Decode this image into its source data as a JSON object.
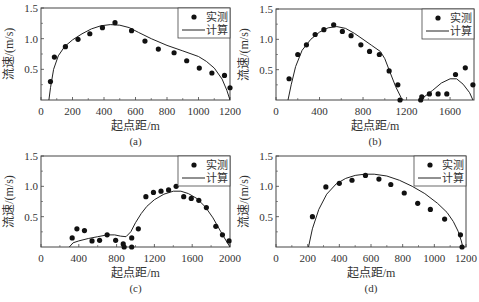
{
  "figure": {
    "legend": {
      "measured": "实测",
      "computed": "计算"
    },
    "xlabel": "起点距/m",
    "ylabel": "流速/(m/s)",
    "colors": {
      "line": "#222222",
      "marker": "#111111",
      "frame": "#444444"
    }
  },
  "chart_data": [
    {
      "type": "line+scatter",
      "panel": "(a)",
      "xlabel": "起点距/m",
      "ylabel": "流速/(m/s)",
      "xlim": [
        0,
        1200
      ],
      "ylim": [
        0,
        1.5
      ],
      "xticks": [
        0,
        200,
        400,
        600,
        800,
        1000,
        1200
      ],
      "xminor": [
        100,
        300,
        500,
        700,
        900,
        1100
      ],
      "yticks": [
        0.5,
        1.0,
        1.5
      ],
      "ytick_labels": [
        "0.5",
        "1.0",
        "1.5"
      ],
      "legend": [
        "实测",
        "计算"
      ],
      "legend_position": "upper right",
      "box": {
        "left": 41,
        "right": 230,
        "top": 8,
        "bottom": 100
      },
      "measured": [
        [
          60,
          0.3
        ],
        [
          85,
          0.7
        ],
        [
          155,
          0.87
        ],
        [
          235,
          0.99
        ],
        [
          310,
          1.08
        ],
        [
          390,
          1.18
        ],
        [
          470,
          1.26
        ],
        [
          575,
          1.13
        ],
        [
          660,
          0.96
        ],
        [
          745,
          0.83
        ],
        [
          845,
          0.77
        ],
        [
          925,
          0.64
        ],
        [
          1005,
          0.52
        ],
        [
          1085,
          0.44
        ],
        [
          1165,
          0.4
        ],
        [
          1200,
          0.2
        ]
      ],
      "computed": [
        [
          50,
          0
        ],
        [
          60,
          0.2
        ],
        [
          80,
          0.5
        ],
        [
          110,
          0.72
        ],
        [
          150,
          0.87
        ],
        [
          200,
          0.98
        ],
        [
          260,
          1.08
        ],
        [
          320,
          1.16
        ],
        [
          380,
          1.21
        ],
        [
          440,
          1.23
        ],
        [
          500,
          1.22
        ],
        [
          560,
          1.18
        ],
        [
          620,
          1.1
        ],
        [
          700,
          1.0
        ],
        [
          800,
          0.89
        ],
        [
          900,
          0.8
        ],
        [
          1000,
          0.71
        ],
        [
          1050,
          0.63
        ],
        [
          1100,
          0.52
        ],
        [
          1150,
          0.34
        ],
        [
          1180,
          0.16
        ],
        [
          1200,
          0
        ]
      ]
    },
    {
      "type": "line+scatter",
      "panel": "(b)",
      "xlabel": "起点距/m",
      "ylabel": "流速/(m/s)",
      "xlim": [
        0,
        1820
      ],
      "ylim": [
        0,
        1.5
      ],
      "xticks": [
        0,
        400,
        800,
        1200,
        1600
      ],
      "xminor": [
        200,
        600,
        1000,
        1400
      ],
      "yticks": [
        0.5,
        1.0,
        1.5
      ],
      "ytick_labels": [
        "0.5",
        "1.0",
        "1.5"
      ],
      "legend": [
        "实测",
        "计算"
      ],
      "legend_position": "upper right",
      "box": {
        "left": 276,
        "right": 474,
        "top": 9,
        "bottom": 100
      },
      "measured": [
        [
          120,
          0.35
        ],
        [
          200,
          0.75
        ],
        [
          280,
          0.91
        ],
        [
          360,
          1.08
        ],
        [
          440,
          1.16
        ],
        [
          530,
          1.24
        ],
        [
          610,
          1.13
        ],
        [
          690,
          1.06
        ],
        [
          780,
          0.91
        ],
        [
          860,
          0.8
        ],
        [
          950,
          0.75
        ],
        [
          1040,
          0.48
        ],
        [
          1120,
          0.25
        ],
        [
          1140,
          0.0
        ],
        [
          1330,
          0.0
        ],
        [
          1340,
          0.05
        ],
        [
          1410,
          0.1
        ],
        [
          1490,
          0.1
        ],
        [
          1570,
          0.1
        ],
        [
          1650,
          0.42
        ],
        [
          1740,
          0.53
        ],
        [
          1810,
          0.25
        ]
      ],
      "computed": [
        [
          110,
          0
        ],
        [
          140,
          0.25
        ],
        [
          180,
          0.55
        ],
        [
          240,
          0.82
        ],
        [
          320,
          1.0
        ],
        [
          400,
          1.12
        ],
        [
          480,
          1.19
        ],
        [
          560,
          1.21
        ],
        [
          640,
          1.18
        ],
        [
          720,
          1.1
        ],
        [
          800,
          1.0
        ],
        [
          880,
          0.9
        ],
        [
          960,
          0.8
        ],
        [
          1000,
          0.68
        ],
        [
          1050,
          0.45
        ],
        [
          1100,
          0.22
        ],
        [
          1150,
          0.04
        ],
        [
          1170,
          0
        ],
        [
          1320,
          0
        ],
        [
          1360,
          0.05
        ],
        [
          1440,
          0.16
        ],
        [
          1520,
          0.28
        ],
        [
          1600,
          0.35
        ],
        [
          1660,
          0.35
        ],
        [
          1720,
          0.26
        ],
        [
          1780,
          0.12
        ],
        [
          1810,
          0
        ]
      ]
    },
    {
      "type": "line+scatter",
      "panel": "(c)",
      "xlabel": "起点距/m",
      "ylabel": "流速/(m/s)",
      "xlim": [
        0,
        2000
      ],
      "ylim": [
        0,
        1.5
      ],
      "xticks": [
        0,
        400,
        800,
        1200,
        1600,
        2000
      ],
      "xminor": [
        200,
        600,
        1000,
        1400,
        1800
      ],
      "yticks": [
        0.5,
        1.0,
        1.5
      ],
      "ytick_labels": [
        "0.5",
        "1.0",
        "1.5"
      ],
      "legend": [
        "实测",
        "计算"
      ],
      "legend_position": "upper right",
      "box": {
        "left": 41,
        "right": 230,
        "top": 156,
        "bottom": 247
      },
      "measured": [
        [
          330,
          0.15
        ],
        [
          380,
          0.3
        ],
        [
          460,
          0.27
        ],
        [
          540,
          0.1
        ],
        [
          620,
          0.11
        ],
        [
          700,
          0.2
        ],
        [
          790,
          0.11
        ],
        [
          870,
          0.05
        ],
        [
          880,
          0.0
        ],
        [
          960,
          0.0
        ],
        [
          960,
          0.15
        ],
        [
          1030,
          0.3
        ],
        [
          1110,
          0.83
        ],
        [
          1190,
          0.9
        ],
        [
          1270,
          0.92
        ],
        [
          1350,
          0.94
        ],
        [
          1430,
          1.0
        ],
        [
          1510,
          0.83
        ],
        [
          1590,
          0.8
        ],
        [
          1670,
          0.77
        ],
        [
          1750,
          0.65
        ],
        [
          1850,
          0.34
        ],
        [
          1920,
          0.2
        ],
        [
          1990,
          0.1
        ]
      ],
      "computed": [
        [
          300,
          0
        ],
        [
          340,
          0.07
        ],
        [
          400,
          0.1
        ],
        [
          500,
          0.14
        ],
        [
          600,
          0.17
        ],
        [
          700,
          0.2
        ],
        [
          780,
          0.2
        ],
        [
          840,
          0.18
        ],
        [
          900,
          0.17
        ],
        [
          950,
          0.25
        ],
        [
          1000,
          0.4
        ],
        [
          1060,
          0.55
        ],
        [
          1120,
          0.67
        ],
        [
          1200,
          0.78
        ],
        [
          1300,
          0.87
        ],
        [
          1400,
          0.92
        ],
        [
          1480,
          0.92
        ],
        [
          1560,
          0.88
        ],
        [
          1650,
          0.8
        ],
        [
          1740,
          0.66
        ],
        [
          1820,
          0.48
        ],
        [
          1900,
          0.26
        ],
        [
          1960,
          0.1
        ],
        [
          2000,
          0
        ]
      ]
    },
    {
      "type": "line+scatter",
      "panel": "(d)",
      "xlabel": "起点距/m",
      "ylabel": "流速/(m/s)",
      "xlim": [
        0,
        1200
      ],
      "ylim": [
        0,
        1.5
      ],
      "xticks": [
        0,
        200,
        400,
        600,
        800,
        1000,
        1200
      ],
      "xminor": [
        100,
        300,
        500,
        700,
        900,
        1100
      ],
      "yticks": [
        0.5,
        1.0,
        1.5
      ],
      "ytick_labels": [
        "0.5",
        "1.0",
        "1.5"
      ],
      "legend": [
        "实测",
        "计算"
      ],
      "legend_position": "upper right",
      "box": {
        "left": 276,
        "right": 466,
        "top": 156,
        "bottom": 247
      },
      "measured": [
        [
          230,
          0.5
        ],
        [
          315,
          0.99
        ],
        [
          400,
          1.05
        ],
        [
          480,
          1.1
        ],
        [
          565,
          1.18
        ],
        [
          650,
          1.12
        ],
        [
          725,
          1.03
        ],
        [
          810,
          0.89
        ],
        [
          895,
          0.72
        ],
        [
          975,
          0.62
        ],
        [
          1065,
          0.46
        ],
        [
          1165,
          0.2
        ],
        [
          1175,
          0.0
        ]
      ],
      "computed": [
        [
          205,
          0
        ],
        [
          230,
          0.3
        ],
        [
          270,
          0.62
        ],
        [
          320,
          0.87
        ],
        [
          380,
          1.04
        ],
        [
          440,
          1.13
        ],
        [
          500,
          1.18
        ],
        [
          560,
          1.2
        ],
        [
          620,
          1.2
        ],
        [
          700,
          1.17
        ],
        [
          780,
          1.1
        ],
        [
          860,
          1.0
        ],
        [
          940,
          0.88
        ],
        [
          1020,
          0.72
        ],
        [
          1080,
          0.57
        ],
        [
          1120,
          0.42
        ],
        [
          1150,
          0.26
        ],
        [
          1170,
          0.1
        ],
        [
          1180,
          0
        ]
      ]
    }
  ]
}
